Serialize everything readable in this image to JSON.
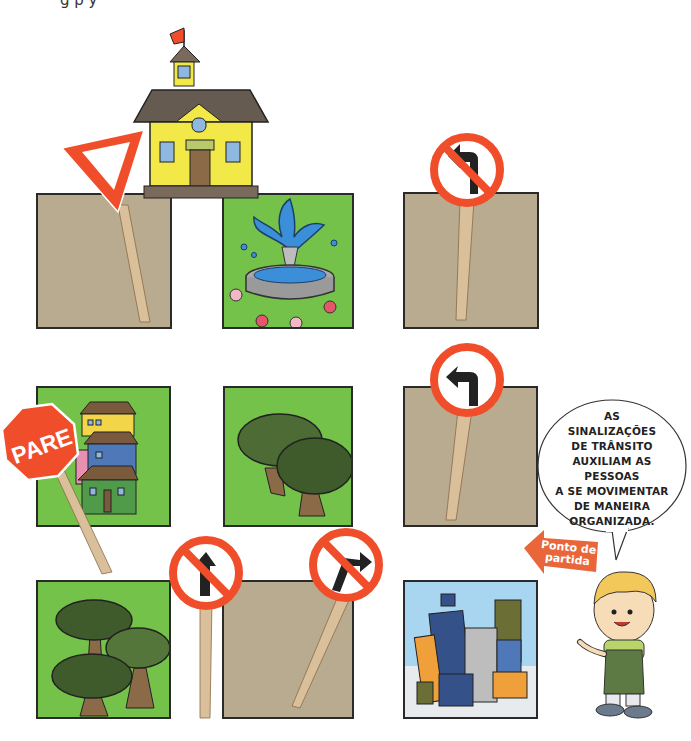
{
  "header": {
    "cut_off_text": "g                             p                              y"
  },
  "colors": {
    "ground_tan": "#b8ab90",
    "grass_green": "#74c24a",
    "sign_red": "#f04e2a",
    "post_wood": "#d9c09a",
    "border": "#2a2a2a",
    "arrow_orange": "#e8663a"
  },
  "grid": {
    "rows": [
      {
        "cells": [
          {
            "type": "ground",
            "sign": "yield-sign"
          },
          {
            "type": "fountain-park",
            "sign": null
          },
          {
            "type": "ground",
            "sign": "no-left-turn-sign"
          }
        ]
      },
      {
        "cells": [
          {
            "type": "houses",
            "sign": "stop-sign"
          },
          {
            "type": "trees",
            "sign": null
          },
          {
            "type": "ground",
            "sign": "turn-left-sign"
          }
        ]
      },
      {
        "cells": [
          {
            "type": "trees",
            "sign": null
          },
          {
            "type": "ground",
            "sign": "no-straight-ahead-sign"
          },
          {
            "type": "city-buildings",
            "sign": "no-right-turn-sign"
          }
        ]
      }
    ]
  },
  "landmarks": {
    "school": "school-building"
  },
  "signs": {
    "stop_label": "PARE"
  },
  "speech_bubble": {
    "lines": [
      "AS",
      "SINALIZAÇÕES",
      "DE TRÂNSITO",
      "AUXILIAM AS",
      "PESSOAS",
      "A SE MOVIMENTAR",
      "DE MANEIRA",
      "ORGANIZADA."
    ]
  },
  "start_arrow": {
    "lines": [
      "Ponto de",
      "partida"
    ]
  },
  "character": {
    "name": "boy-guide"
  }
}
